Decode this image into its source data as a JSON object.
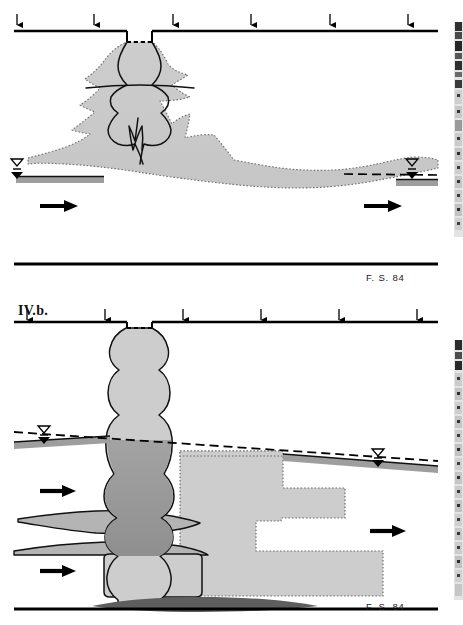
{
  "figure": {
    "id_label": "IV.b.",
    "domain": "hydrogeology-cross-section",
    "panel_count": 2,
    "background_color": "#ffffff",
    "ink_color": "#000000"
  },
  "palette": {
    "ink": "#000000",
    "plume_light": "#cbcbcb",
    "plume_mid": "#b9b9b9",
    "plume_dark": "#9a9a9a",
    "water_band": "#9e9e9e",
    "dotted_outline": "#6e6e6e",
    "scan_artifact_dark": "#2b2b2b",
    "scan_artifact_light": "#c9c9c9"
  },
  "panels": [
    {
      "name": "panel-upper",
      "source_credit": "F. S. 84",
      "top_boundary": {
        "label": "ground-surface-line",
        "well_notch": {
          "present": true,
          "style": "dashed-cap",
          "x_center": 140
        }
      },
      "bottom_boundary": {
        "label": "impermeable-base-line"
      },
      "recharge_arrows": {
        "count": 6,
        "direction": "down",
        "x_positions": [
          17,
          94,
          173,
          251,
          330,
          408
        ]
      },
      "flow_arrows": {
        "count": 2,
        "direction": "right",
        "positions": [
          {
            "x": 55,
            "y": 206
          },
          {
            "x": 380,
            "y": 206
          }
        ]
      },
      "water_table_symbols": [
        {
          "side": "left",
          "x": 18,
          "y": 160
        },
        {
          "side": "right",
          "x": 412,
          "y": 160
        }
      ],
      "plume": {
        "shape": "mushroom-spreading",
        "outline_style": "dotted",
        "fill": "plume_light",
        "internal_contours": 1,
        "description": "vertically injected plume spreading laterally then drifting down-gradient to the right"
      }
    },
    {
      "name": "panel-lower",
      "source_credit": "F. S. 84",
      "top_boundary": {
        "label": "ground-surface-line",
        "well_notch": {
          "present": true,
          "style": "dashed-cap",
          "x_center": 140
        }
      },
      "bottom_boundary": {
        "label": "impermeable-base-line"
      },
      "recharge_arrows": {
        "count": 6,
        "direction": "down",
        "x_positions": [
          27,
          105,
          183,
          261,
          339,
          417
        ]
      },
      "flow_arrows": {
        "count": 3,
        "direction": "right",
        "positions": [
          {
            "x": 55,
            "y": 195
          },
          {
            "x": 55,
            "y": 275
          },
          {
            "x": 385,
            "y": 235
          }
        ]
      },
      "water_table_symbols": [
        {
          "side": "left",
          "x": 44,
          "y": 130
        },
        {
          "side": "right",
          "x": 378,
          "y": 162
        }
      ],
      "plume": {
        "shape": "bulbous-column-with-stepped-tail",
        "outline_style": "solid-and-dotted",
        "fill_primary": "plume_light",
        "fill_saturated": "plume_dark",
        "stepped_lobes": 3,
        "description": "beaded vertical infiltration column feeding a stair-stepped down-gradient plume"
      }
    }
  ],
  "scan_artifact": {
    "present": true,
    "position": "right-edge",
    "width_px": 9,
    "description": "film-border speckle strip from the original scan"
  }
}
